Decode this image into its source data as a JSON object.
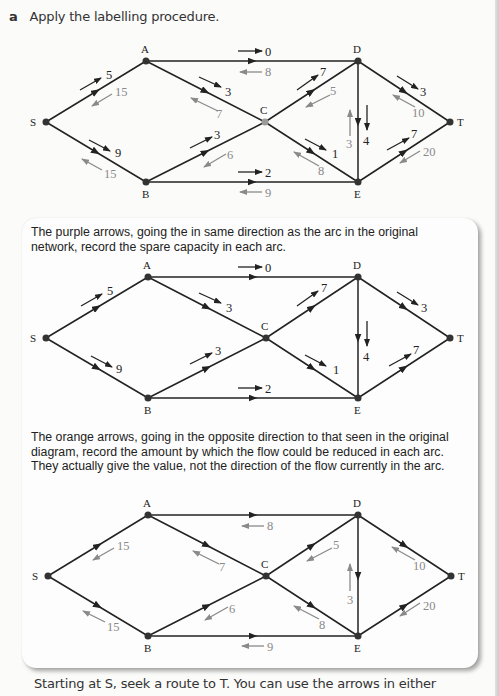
{
  "question": {
    "letter": "a",
    "instruction": "Apply the labelling procedure."
  },
  "box": {
    "paragraph_purple": "The purple arrows, going the in same direction as the arc in the original network, record the spare capacity in each arc.",
    "paragraph_orange": "The orange arrows, going in the opposite direction to that seen in the original diagram, record the amount by which the flow could be reduced in each arc. They actually give the value, not the direction of the flow currently in the arc."
  },
  "footer": {
    "text": "Starting at S, seek a route to T. You can use the arrows in either"
  },
  "nodes": {
    "S": "S",
    "A": "A",
    "B": "B",
    "C": "C",
    "D": "D",
    "E": "E",
    "T": "T"
  },
  "network": {
    "arcs": [
      {
        "from": "S",
        "to": "A",
        "spare": "5",
        "reduce": "15"
      },
      {
        "from": "S",
        "to": "B",
        "spare": "9",
        "reduce": "15"
      },
      {
        "from": "A",
        "to": "D",
        "spare": "0",
        "reduce": "8"
      },
      {
        "from": "A",
        "to": "C",
        "spare": "3",
        "reduce": "7"
      },
      {
        "from": "B",
        "to": "C",
        "spare": "3",
        "reduce": "6"
      },
      {
        "from": "B",
        "to": "E",
        "spare": "2",
        "reduce": "9"
      },
      {
        "from": "C",
        "to": "D",
        "spare": "7",
        "reduce": "5"
      },
      {
        "from": "C",
        "to": "E",
        "spare": "1",
        "reduce": "8"
      },
      {
        "from": "D",
        "to": "E",
        "spare": "4",
        "reduce": "3"
      },
      {
        "from": "D",
        "to": "T",
        "spare": "3",
        "reduce": "10"
      },
      {
        "from": "E",
        "to": "T",
        "spare": "7",
        "reduce": "20"
      }
    ]
  },
  "colors": {
    "spare_arrow": "#222222",
    "reduce_arrow": "#8a8a8a",
    "node": "#333333",
    "node_c_first": "#9a9a9a"
  }
}
